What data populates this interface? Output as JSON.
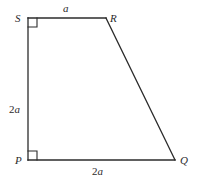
{
  "figure": {
    "name": "trapezoid-pqrs",
    "background_color": "#ffffff",
    "stroke_color": "#2b2b2b",
    "text_color": "#2b2b2b",
    "stroke_width": 1.3,
    "vertices": [
      {
        "id": "S",
        "label": "S",
        "x": 28,
        "y": 18
      },
      {
        "id": "R",
        "label": "R",
        "x": 106,
        "y": 18
      },
      {
        "id": "Q",
        "label": "Q",
        "x": 175,
        "y": 160
      },
      {
        "id": "P",
        "label": "P",
        "x": 28,
        "y": 160
      }
    ],
    "edges": [
      {
        "id": "SR",
        "from": "S",
        "to": "R",
        "label": "a",
        "label_prefix": "",
        "label_var": "a"
      },
      {
        "id": "RQ",
        "from": "R",
        "to": "Q",
        "label": "",
        "label_prefix": "",
        "label_var": ""
      },
      {
        "id": "PQ",
        "from": "P",
        "to": "Q",
        "label": "2a",
        "label_prefix": "2",
        "label_var": "a"
      },
      {
        "id": "SP",
        "from": "S",
        "to": "P",
        "label": "2a",
        "label_prefix": "2",
        "label_var": "a"
      }
    ],
    "right_angle_markers": [
      {
        "id": "right-angle-S",
        "at": "S",
        "size": 9,
        "dir_x": 1,
        "dir_y": 1
      },
      {
        "id": "right-angle-P",
        "at": "P",
        "size": 9,
        "dir_x": 1,
        "dir_y": -1
      }
    ],
    "labels": {
      "vertex_S": "S",
      "vertex_R": "R",
      "vertex_P": "P",
      "vertex_Q": "Q",
      "side_top_prefix": "",
      "side_top_var": "a",
      "side_left_prefix": "2",
      "side_left_var": "a",
      "side_bottom_prefix": "2",
      "side_bottom_var": "a"
    }
  }
}
